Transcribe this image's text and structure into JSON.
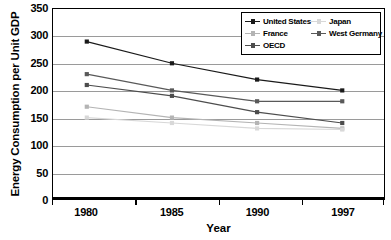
{
  "chart_data": {
    "type": "line",
    "title": "",
    "xlabel": "Year",
    "ylabel": "Energy Consumption per Unit GDP",
    "x": [
      "1980",
      "1985",
      "1990",
      "1997"
    ],
    "xtick_labels": [
      "1980",
      "1985",
      "1990",
      "1997"
    ],
    "ytick_labels": [
      "0",
      "50",
      "100",
      "150",
      "200",
      "250",
      "300",
      "350"
    ],
    "yticks": [
      0,
      50,
      100,
      150,
      200,
      250,
      300,
      350
    ],
    "ylim": [
      0,
      350
    ],
    "grid": true,
    "legend_position": "top-right",
    "series": [
      {
        "name": "United States",
        "values": [
          290,
          250,
          220,
          200
        ],
        "color": "#1a1a1a",
        "marker": "square"
      },
      {
        "name": "France",
        "values": [
          170,
          150,
          140,
          130
        ],
        "color": "#b4b4b4",
        "marker": "square"
      },
      {
        "name": "OECD",
        "values": [
          210,
          190,
          160,
          140
        ],
        "color": "#4d4d4d",
        "marker": "square"
      },
      {
        "name": "Japan",
        "values": [
          150,
          140,
          130,
          128
        ],
        "color": "#d8d8d8",
        "marker": "square"
      },
      {
        "name": "West Germany",
        "values": [
          230,
          200,
          180,
          180
        ],
        "color": "#595959",
        "marker": "square"
      }
    ]
  },
  "legend": {
    "entries": [
      {
        "label": "United States",
        "color": "#1a1a1a"
      },
      {
        "label": "Japan",
        "color": "#d8d8d8"
      },
      {
        "label": "France",
        "color": "#b4b4b4"
      },
      {
        "label": "West Germany",
        "color": "#595959"
      },
      {
        "label": "OECD",
        "color": "#4d4d4d"
      }
    ]
  },
  "axes": {
    "y_title": "Energy Consumption per Unit GDP",
    "x_title": "Year"
  }
}
